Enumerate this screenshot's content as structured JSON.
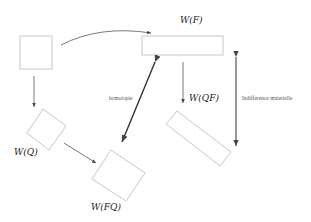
{
  "diagram": {
    "nodes": [
      {
        "id": "Q0",
        "label": ""
      },
      {
        "id": "F",
        "label": "W(F)"
      },
      {
        "id": "Q",
        "label": "W(Q)"
      },
      {
        "id": "FQ",
        "label": "W(FQ)"
      },
      {
        "id": "QF",
        "label": "W(QF)"
      }
    ],
    "edge_labels": {
      "homotopy": "homotopie",
      "indifference": "Indifference materielle"
    },
    "colors": {
      "box_stroke": "#c8c8c8",
      "arrow_light": "#555555",
      "arrow_heavy": "#333333"
    }
  }
}
